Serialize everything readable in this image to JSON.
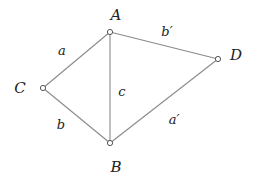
{
  "diagram": {
    "type": "graph",
    "nodes": [
      {
        "id": "A",
        "label": "A",
        "x": 110,
        "y": 32,
        "label_x": 116,
        "label_y": 20
      },
      {
        "id": "B",
        "label": "B",
        "x": 110,
        "y": 143,
        "label_x": 116,
        "label_y": 172
      },
      {
        "id": "C",
        "label": "C",
        "x": 43,
        "y": 88,
        "label_x": 20,
        "label_y": 93
      },
      {
        "id": "D",
        "label": "D",
        "x": 218,
        "y": 59,
        "label_x": 236,
        "label_y": 60
      }
    ],
    "edges": [
      {
        "from": "A",
        "to": "C",
        "label": "a",
        "label_x": 62,
        "label_y": 55
      },
      {
        "from": "A",
        "to": "D",
        "label": "b′",
        "label_x": 167,
        "label_y": 36
      },
      {
        "from": "A",
        "to": "B",
        "label": "c",
        "label_x": 122,
        "label_y": 96
      },
      {
        "from": "C",
        "to": "B",
        "label": "b",
        "label_x": 61,
        "label_y": 129
      },
      {
        "from": "D",
        "to": "B",
        "label": "a′",
        "label_x": 174,
        "label_y": 124
      }
    ]
  }
}
